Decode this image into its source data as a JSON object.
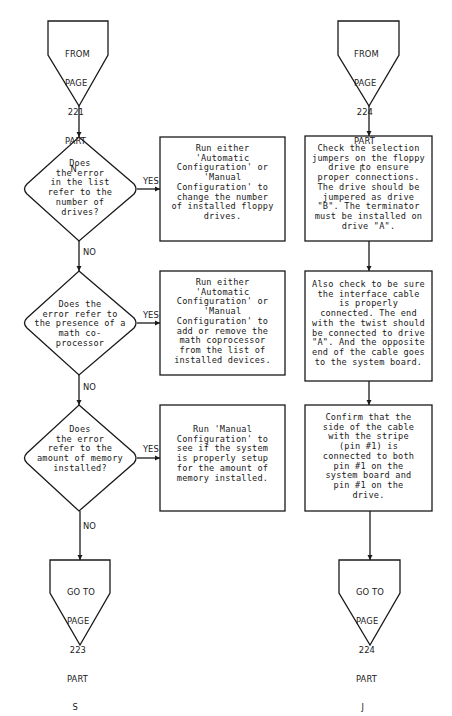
{
  "flowchart": {
    "left_column": {
      "start_connector": {
        "lines": [
          "FROM",
          "PAGE",
          " 221",
          "PART",
          "  N"
        ]
      },
      "decisions": [
        {
          "question": "Does\nthe error\nin the list\nrefer to the\nnumber of\ndrives?",
          "yes_label": "YES",
          "no_label": "NO",
          "action": "Run either\n'Automatic\nConfiguration' or\n'Manual\nConfiguration' to\nchange the number\nof installed floppy\ndrives."
        },
        {
          "question": "Does the\nerror refer to\nthe presence of a\nmath co-\nprocessor",
          "yes_label": "YES",
          "no_label": "NO",
          "action": "Run either\n'Automatic\nConfiguration' or\n'Manual\nConfiguration' to\nadd or remove the\nmath coprocessor\nfrom the list of\ninstalled devices."
        },
        {
          "question": "Does\nthe error\nrefer to the\namount of memory\ninstalled?",
          "yes_label": "YES",
          "no_label": "NO",
          "action": "Run 'Manual\nConfiguration' to\nsee if the system\nis properly setup\nfor the amount of\nmemory installed."
        }
      ],
      "end_connector": {
        "lines": [
          "GO TO",
          "PAGE",
          " 223",
          "PART",
          "  S"
        ]
      }
    },
    "right_column": {
      "start_connector": {
        "lines": [
          "FROM",
          "PAGE",
          " 224",
          "PART",
          "  I"
        ]
      },
      "steps": [
        "Check the selection\njumpers on the floppy\ndrive to ensure\nproper connections.\nThe drive should be\njumpered as drive\n\"B\". The terminator\nmust be installed on\ndrive \"A\".",
        "Also check to be sure\nthe interface cable\nis properly\nconnected. The end\nwith the twist should\nbe connected to drive\n\"A\". And the opposite\nend of the cable goes\nto the system board.",
        "Confirm that the\nside of the cable\nwith the stripe\n(pin #1) is\nconnected to both\npin #1 on the\nsystem board and\npin #1 on the\ndrive."
      ],
      "end_connector": {
        "lines": [
          "GO TO",
          "PAGE",
          " 224",
          "PART",
          "  J"
        ]
      }
    },
    "colors": {
      "stroke": "#1a1a1a",
      "background": "#ffffff"
    }
  }
}
